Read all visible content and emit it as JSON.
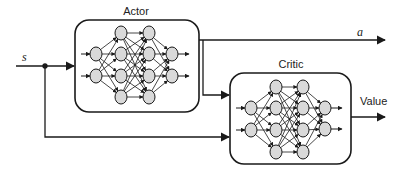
{
  "diagram": {
    "type": "actor-critic architecture",
    "input_label": "s",
    "action_label": "a",
    "value_label": "Value",
    "actor": {
      "title": "Actor",
      "box": {
        "x": 75,
        "y": 20,
        "w": 124,
        "h": 92
      },
      "layers": [
        {
          "x": 96,
          "ys": [
            54,
            76
          ]
        },
        {
          "x": 121,
          "ys": [
            33,
            54,
            76,
            97
          ]
        },
        {
          "x": 149,
          "ys": [
            33,
            54,
            76,
            97
          ]
        },
        {
          "x": 172,
          "ys": [
            54,
            76
          ]
        }
      ]
    },
    "critic": {
      "title": "Critic",
      "box": {
        "x": 230,
        "y": 73,
        "w": 121,
        "h": 91
      },
      "layers": [
        {
          "x": 251,
          "ys": [
            108,
            130
          ]
        },
        {
          "x": 276,
          "ys": [
            87,
            108,
            130,
            152
          ]
        },
        {
          "x": 303,
          "ys": [
            87,
            108,
            130,
            152
          ]
        },
        {
          "x": 325,
          "ys": [
            108,
            129
          ]
        }
      ]
    },
    "colors": {
      "stroke": "#1a1a1a",
      "node_fill": "#d9d9d9",
      "background": "#ffffff"
    }
  }
}
